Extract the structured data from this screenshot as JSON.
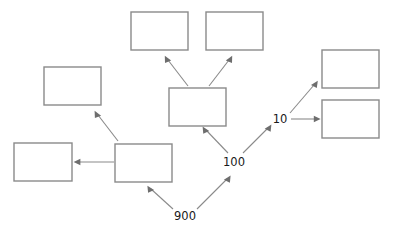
{
  "diagram": {
    "type": "node-link-tree",
    "canvas": {
      "width": 398,
      "height": 238,
      "background": "#ffffff"
    },
    "style": {
      "box_stroke": "#8a8a8a",
      "box_fill": "#ffffff",
      "edge_stroke": "#8a8a8a",
      "arrow_fill": "#6e6e6e",
      "label_color": "#1a1a1a"
    },
    "nodes": [
      {
        "id": "box-top-left",
        "label": "",
        "x": 131,
        "y": 12,
        "w": 57,
        "h": 38
      },
      {
        "id": "box-top-right",
        "label": "",
        "x": 206,
        "y": 12,
        "w": 57,
        "h": 38
      },
      {
        "id": "box-left-upper",
        "label": "",
        "x": 44,
        "y": 67,
        "w": 57,
        "h": 38
      },
      {
        "id": "box-center",
        "label": "",
        "x": 169,
        "y": 88,
        "w": 57,
        "h": 38
      },
      {
        "id": "box-right-upper",
        "label": "",
        "x": 322,
        "y": 50,
        "w": 57,
        "h": 38
      },
      {
        "id": "box-right-lower",
        "label": "",
        "x": 322,
        "y": 100,
        "w": 57,
        "h": 38
      },
      {
        "id": "box-bottom-left",
        "label": "",
        "x": 14,
        "y": 143,
        "w": 58,
        "h": 38
      },
      {
        "id": "box-bottom-mid",
        "label": "",
        "x": 115,
        "y": 144,
        "w": 57,
        "h": 38
      }
    ],
    "junctions": [
      {
        "id": "junction-900",
        "label": "900",
        "x": 185,
        "y": 216
      },
      {
        "id": "junction-100",
        "label": "100",
        "x": 234,
        "y": 162
      },
      {
        "id": "junction-10",
        "label": "10",
        "x": 280,
        "y": 119
      }
    ],
    "edges": [
      {
        "id": "edge-center-to-top-left",
        "from": "box-center",
        "to": "box-top-left",
        "direction": "up-left"
      },
      {
        "id": "edge-center-to-top-right",
        "from": "box-center",
        "to": "box-top-right",
        "direction": "up-right"
      },
      {
        "id": "edge-100-to-center",
        "from": "junction-100",
        "to": "box-center",
        "direction": "up-left"
      },
      {
        "id": "edge-900-to-100",
        "from": "junction-900",
        "to": "junction-100",
        "direction": "up-right"
      },
      {
        "id": "edge-900-to-bottom-mid",
        "from": "junction-900",
        "to": "box-bottom-mid",
        "direction": "up-left"
      },
      {
        "id": "edge-bottom-mid-to-bottom-left",
        "from": "box-bottom-mid",
        "to": "box-bottom-left",
        "direction": "left"
      },
      {
        "id": "edge-bottom-mid-to-left-upper",
        "from": "box-bottom-mid",
        "to": "box-left-upper",
        "direction": "up-left"
      },
      {
        "id": "edge-100-to-10",
        "from": "junction-100",
        "to": "junction-10",
        "direction": "up-right"
      },
      {
        "id": "edge-10-to-right-upper",
        "from": "junction-10",
        "to": "box-right-upper",
        "direction": "up-right"
      },
      {
        "id": "edge-10-to-right-lower",
        "from": "junction-10",
        "to": "box-right-lower",
        "direction": "right"
      }
    ]
  }
}
